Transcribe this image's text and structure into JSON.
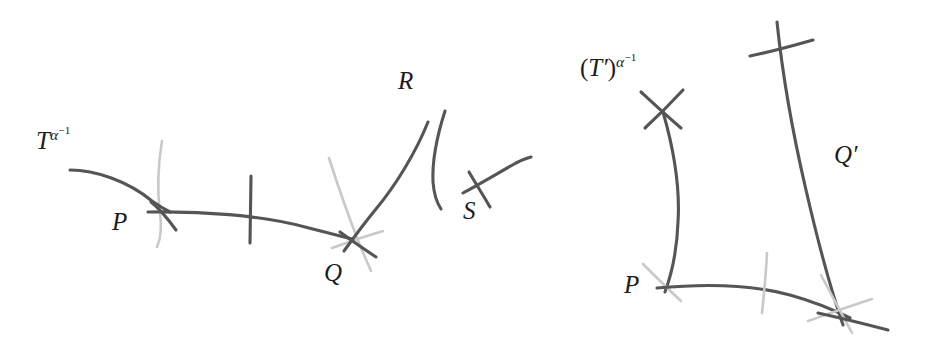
{
  "figure": {
    "name": "braid-curve-crossing-diagram",
    "background_color": "#ffffff",
    "stroke_dark_color": "#555555",
    "stroke_light_color": "#c9c9c9",
    "text_color": "#1c1c1c"
  },
  "left_diagram": {
    "name": "left-panel",
    "curve_label": {
      "base": "T",
      "exponent_base": "α",
      "exponent_sup": "−1",
      "full": "T^{α^{-1}}"
    },
    "points": [
      {
        "id": "P",
        "label": "P"
      },
      {
        "id": "Q",
        "label": "Q"
      },
      {
        "id": "R",
        "label": "R"
      },
      {
        "id": "S",
        "label": "S"
      }
    ]
  },
  "right_diagram": {
    "name": "right-panel",
    "curve_label": {
      "open_paren": "(",
      "base": "T",
      "prime": "′",
      "close_paren": ")",
      "exponent_base": "α",
      "exponent_sup": "−1",
      "full": "(T′)^{α^{-1}}"
    },
    "points": [
      {
        "id": "P",
        "label": "P"
      },
      {
        "id": "Qprime",
        "label": "Q′"
      }
    ]
  }
}
